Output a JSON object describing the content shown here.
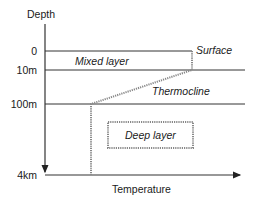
{
  "diagram": {
    "type": "ocean-temperature-depth-profile",
    "axes": {
      "y_label": "Depth",
      "x_label": "Temperature",
      "y_ticks": [
        "0",
        "10m",
        "100m",
        "4km"
      ]
    },
    "layers": {
      "surface": "Surface",
      "mixed": "Mixed layer",
      "thermocline": "Thermocline",
      "deep": "Deep layer"
    },
    "colors": {
      "line": "#333333",
      "profile": "#888888",
      "box_border": "#888888"
    }
  }
}
